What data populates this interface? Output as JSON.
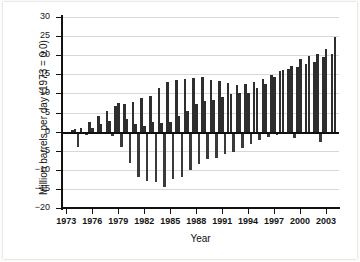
{
  "chart_data": {
    "type": "bar",
    "title": "",
    "xlabel": "Year",
    "ylabel": "Million barrels per day (1973 = 0.0)",
    "ylim": [
      -20,
      30
    ],
    "yticks": [
      30,
      25,
      20,
      15,
      10,
      5,
      0,
      -5,
      -10,
      -15,
      -20
    ],
    "ytick_labels": [
      "30",
      "25",
      "20",
      "15",
      "10",
      "5",
      "0",
      "-5",
      "-10",
      "-15",
      "-20"
    ],
    "xlim": [
      1973,
      2004
    ],
    "xticks": [
      1973,
      1976,
      1979,
      1982,
      1985,
      1988,
      1991,
      1994,
      1997,
      2000,
      2003
    ],
    "xtick_labels": [
      "1973",
      "1976",
      "1979",
      "1982",
      "1985",
      "1988",
      "1991",
      "1994",
      "1997",
      "2000",
      "2003"
    ],
    "grid": true,
    "legend": false,
    "bar_color": "#2e2e2e",
    "categories": [
      1973,
      1974,
      1975,
      1976,
      1977,
      1978,
      1979,
      1980,
      1981,
      1982,
      1983,
      1984,
      1985,
      1986,
      1987,
      1988,
      1989,
      1990,
      1991,
      1992,
      1993,
      1994,
      1995,
      1996,
      1997,
      1998,
      1999,
      2000,
      2001,
      2002,
      2003,
      2004
    ],
    "series": [
      {
        "name": "positive",
        "values": [
          0.0,
          0.3,
          1.0,
          2.4,
          4.1,
          5.3,
          6.6,
          7.3,
          7.7,
          8.7,
          9.3,
          11.3,
          12.9,
          13.5,
          13.7,
          14.0,
          14.4,
          13.5,
          13.2,
          12.7,
          12.3,
          12.4,
          12.9,
          13.8,
          14.9,
          15.8,
          16.5,
          17.0,
          17.6,
          18.2,
          19.5,
          20.4
        ]
      },
      {
        "name": "secondary",
        "values": [
          -0.2,
          0.6,
          -0.6,
          0.9,
          2.0,
          2.8,
          7.6,
          3.3,
          2.1,
          1.4,
          2.5,
          2.3,
          2.6,
          4.2,
          5.3,
          7.2,
          7.9,
          8.2,
          9.0,
          9.8,
          10.1,
          10.1,
          11.3,
          12.5,
          14.3,
          16.0,
          17.1,
          18.9,
          19.9,
          20.3,
          21.5,
          24.8
        ]
      },
      {
        "name": "negative",
        "values": [
          -0.3,
          -4.1,
          -1.0,
          0.0,
          0.0,
          -1.2,
          -4.0,
          -8.1,
          -11.9,
          -13.0,
          -13.3,
          -14.5,
          -12.4,
          -12.0,
          -10.0,
          -8.4,
          -7.2,
          -6.8,
          -5.9,
          -5.4,
          -4.3,
          -3.3,
          -2.2,
          -1.4,
          -0.9,
          -0.7,
          -1.6,
          -0.5,
          -0.6,
          -2.6,
          -0.5,
          -0.4
        ]
      }
    ],
    "note": "Paired vertical bars per year: an upward bar and a downward bar for each year from 1973 through 2004."
  }
}
